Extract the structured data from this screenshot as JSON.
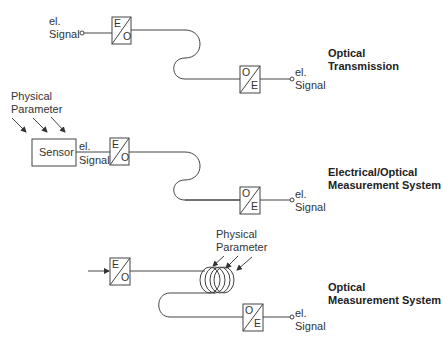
{
  "sections": [
    {
      "title_line1": "Optical",
      "title_line2": "Transmission",
      "input_label_line1": "el.",
      "input_label_line2": "Signal",
      "converter_in": {
        "top": "E",
        "bottom": "O"
      },
      "converter_out": {
        "top": "O",
        "bottom": "E"
      },
      "output_label_line1": "el.",
      "output_label_line2": "Signal"
    },
    {
      "title_line1": "Electrical/Optical",
      "title_line2": "Measurement System",
      "param_line1": "Physical",
      "param_line2": "Parameter",
      "sensor_label": "Sensor",
      "input_label_line1": "el.",
      "input_label_line2": "Signal",
      "converter_in": {
        "top": "E",
        "bottom": "O"
      },
      "converter_out": {
        "top": "O",
        "bottom": "E"
      },
      "output_label_line1": "el.",
      "output_label_line2": "Signal"
    },
    {
      "title_line1": "Optical",
      "title_line2": "Measurement System",
      "param_line1": "Physical",
      "param_line2": "Parameter",
      "converter_in": {
        "top": "E",
        "bottom": "O"
      },
      "converter_out": {
        "top": "O",
        "bottom": "E"
      },
      "output_label_line1": "el.",
      "output_label_line2": "Signal"
    }
  ],
  "colors": {
    "line": "#444444",
    "text": "#222222",
    "background": "#ffffff"
  }
}
